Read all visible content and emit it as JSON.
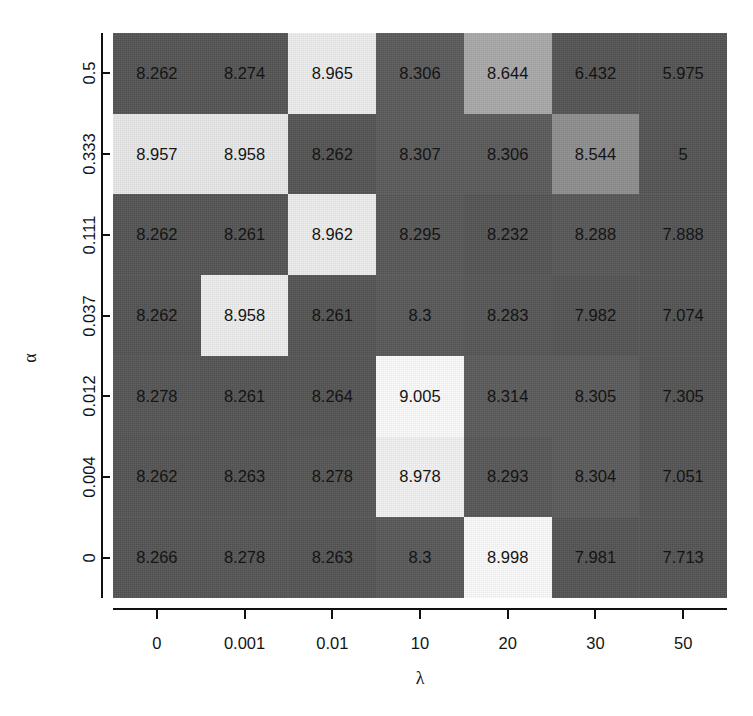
{
  "figure": {
    "bleed_text": " ",
    "background": "#ffffff"
  },
  "axes": {
    "x_label": "λ",
    "y_label": "α",
    "x_ticks": [
      "0",
      "0.001",
      "0.01",
      "10",
      "20",
      "30",
      "50"
    ],
    "y_ticks": [
      "0.5",
      "0.333",
      "0.111",
      "0.037",
      "0.012",
      "0.004",
      "0"
    ]
  },
  "colors": {
    "base_dark": "#545454",
    "mid_gray": "#8e8e8e",
    "light_gray": "#a9a9a9",
    "pale": "#e2e2e2",
    "near_white": "#ededed",
    "white": "#fbfbfb",
    "text": "#141414",
    "page": "#ffffff"
  },
  "chart_data": {
    "type": "heatmap",
    "title": "",
    "xlabel": "λ",
    "ylabel": "α",
    "x_categories": [
      "0",
      "0.001",
      "0.01",
      "10",
      "20",
      "30",
      "50"
    ],
    "y_categories": [
      "0.5",
      "0.333",
      "0.111",
      "0.037",
      "0.012",
      "0.004",
      "0"
    ],
    "grid": false,
    "legend": "none",
    "value_range": [
      5,
      9.005
    ],
    "colormap": "grayscale-low-to-high",
    "rows": [
      {
        "y": "0.5",
        "cells": [
          {
            "x": "0",
            "value": "8.262",
            "shade": "#545454"
          },
          {
            "x": "0.001",
            "value": "8.274",
            "shade": "#545454"
          },
          {
            "x": "0.01",
            "value": "8.965",
            "shade": "#ededed"
          },
          {
            "x": "10",
            "value": "8.306",
            "shade": "#5a5a5a"
          },
          {
            "x": "20",
            "value": "8.644",
            "shade": "#a9a9a9"
          },
          {
            "x": "30",
            "value": "6.432",
            "shade": "#545454"
          },
          {
            "x": "50",
            "value": "5.975",
            "shade": "#545454"
          }
        ]
      },
      {
        "y": "0.333",
        "cells": [
          {
            "x": "0",
            "value": "8.957",
            "shade": "#e8e8e8"
          },
          {
            "x": "0.001",
            "value": "8.958",
            "shade": "#e8e8e8"
          },
          {
            "x": "0.01",
            "value": "8.262",
            "shade": "#545454"
          },
          {
            "x": "10",
            "value": "8.307",
            "shade": "#5a5a5a"
          },
          {
            "x": "20",
            "value": "8.306",
            "shade": "#5a5a5a"
          },
          {
            "x": "30",
            "value": "8.544",
            "shade": "#8e8e8e"
          },
          {
            "x": "50",
            "value": "5",
            "shade": "#545454"
          }
        ]
      },
      {
        "y": "0.111",
        "cells": [
          {
            "x": "0",
            "value": "8.262",
            "shade": "#545454"
          },
          {
            "x": "0.001",
            "value": "8.261",
            "shade": "#545454"
          },
          {
            "x": "0.01",
            "value": "8.962",
            "shade": "#ededed"
          },
          {
            "x": "10",
            "value": "8.295",
            "shade": "#585858"
          },
          {
            "x": "20",
            "value": "8.232",
            "shade": "#545454"
          },
          {
            "x": "30",
            "value": "8.288",
            "shade": "#575757"
          },
          {
            "x": "50",
            "value": "7.888",
            "shade": "#545454"
          }
        ]
      },
      {
        "y": "0.037",
        "cells": [
          {
            "x": "0",
            "value": "8.262",
            "shade": "#545454"
          },
          {
            "x": "0.001",
            "value": "8.958",
            "shade": "#ededed"
          },
          {
            "x": "0.01",
            "value": "8.261",
            "shade": "#545454"
          },
          {
            "x": "10",
            "value": "8.3",
            "shade": "#585858"
          },
          {
            "x": "20",
            "value": "8.283",
            "shade": "#565656"
          },
          {
            "x": "30",
            "value": "7.982",
            "shade": "#545454"
          },
          {
            "x": "50",
            "value": "7.074",
            "shade": "#545454"
          }
        ]
      },
      {
        "y": "0.012",
        "cells": [
          {
            "x": "0",
            "value": "8.278",
            "shade": "#555555"
          },
          {
            "x": "0.001",
            "value": "8.261",
            "shade": "#545454"
          },
          {
            "x": "0.01",
            "value": "8.264",
            "shade": "#545454"
          },
          {
            "x": "10",
            "value": "9.005",
            "shade": "#fbfbfb"
          },
          {
            "x": "20",
            "value": "8.314",
            "shade": "#5b5b5b"
          },
          {
            "x": "30",
            "value": "8.305",
            "shade": "#5a5a5a"
          },
          {
            "x": "50",
            "value": "7.305",
            "shade": "#545454"
          }
        ]
      },
      {
        "y": "0.004",
        "cells": [
          {
            "x": "0",
            "value": "8.262",
            "shade": "#545454"
          },
          {
            "x": "0.001",
            "value": "8.263",
            "shade": "#545454"
          },
          {
            "x": "0.01",
            "value": "8.278",
            "shade": "#555555"
          },
          {
            "x": "10",
            "value": "8.978",
            "shade": "#f2f2f2"
          },
          {
            "x": "20",
            "value": "8.293",
            "shade": "#575757"
          },
          {
            "x": "30",
            "value": "8.304",
            "shade": "#5a5a5a"
          },
          {
            "x": "50",
            "value": "7.051",
            "shade": "#545454"
          }
        ]
      },
      {
        "y": "0",
        "cells": [
          {
            "x": "0",
            "value": "8.266",
            "shade": "#545454"
          },
          {
            "x": "0.001",
            "value": "8.278",
            "shade": "#555555"
          },
          {
            "x": "0.01",
            "value": "8.263",
            "shade": "#545454"
          },
          {
            "x": "10",
            "value": "8.3",
            "shade": "#585858"
          },
          {
            "x": "20",
            "value": "8.998",
            "shade": "#fbfbfb"
          },
          {
            "x": "30",
            "value": "7.981",
            "shade": "#545454"
          },
          {
            "x": "50",
            "value": "7.713",
            "shade": "#545454"
          }
        ]
      }
    ]
  }
}
